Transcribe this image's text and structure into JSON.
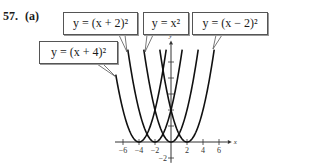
{
  "problem": {
    "number": "57.",
    "part": "(a)"
  },
  "labels": [
    {
      "id": "x-plus-4",
      "text": "y = (x + 4)²",
      "box": [
        39,
        41,
        79,
        23
      ],
      "pointer": [
        [
          100,
          64
        ],
        [
          116,
          77
        ]
      ]
    },
    {
      "id": "x-plus-2",
      "text": "y = (x + 2)²",
      "box": [
        63,
        12,
        75,
        23
      ],
      "pointer": [
        [
          122,
          35
        ],
        [
          127,
          52
        ]
      ]
    },
    {
      "id": "x-squared",
      "text": "y = x²",
      "box": [
        143,
        12,
        46,
        23
      ],
      "pointer": [
        [
          150,
          35
        ],
        [
          145,
          52
        ]
      ]
    },
    {
      "id": "x-minus-2",
      "text": "y = (x − 2)²",
      "box": [
        192,
        12,
        76,
        23
      ],
      "pointer": [
        [
          219,
          35
        ],
        [
          213,
          49
        ]
      ]
    }
  ],
  "chart_data": {
    "type": "line",
    "title": "",
    "xlabel": "x",
    "ylabel": "y",
    "xlim": [
      -7,
      7
    ],
    "ylim": [
      -2,
      12
    ],
    "x_ticks": [
      -6,
      -4,
      -2,
      2,
      4,
      6
    ],
    "x_tick_labels": [
      "−6",
      "−4",
      "−2",
      "2",
      "4",
      "6"
    ],
    "y_ticks": [
      -2,
      2,
      4,
      6,
      8,
      10
    ],
    "y_tick_labels": [
      "−2"
    ],
    "grid": false,
    "series": [
      {
        "name": "y = (x + 4)²",
        "h": -4,
        "x_range": [
          -6.9,
          -0.6
        ]
      },
      {
        "name": "y = (x + 2)²",
        "h": -2,
        "x_range": [
          -5.4,
          1.4
        ]
      },
      {
        "name": "y = x²",
        "h": 0,
        "x_range": [
          -3.4,
          3.4
        ]
      },
      {
        "name": "y = (x − 2)²",
        "h": 2,
        "x_range": [
          -1.4,
          5.4
        ]
      }
    ],
    "vertices": [
      [
        -4,
        0
      ],
      [
        -2,
        0
      ],
      [
        0,
        0
      ],
      [
        2,
        0
      ]
    ]
  },
  "layout": {
    "origin_px": [
      171,
      142
    ],
    "unit_px": 8
  }
}
